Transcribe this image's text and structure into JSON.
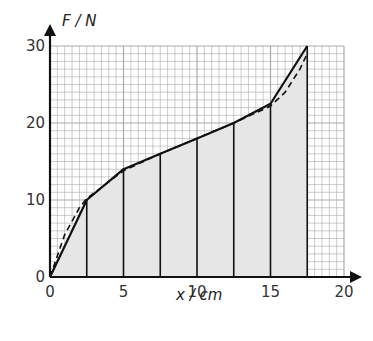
{
  "chart_data": {
    "type": "line",
    "title": "",
    "xlabel": "x / cm",
    "ylabel": "F / N",
    "xlim": [
      0,
      20
    ],
    "ylim": [
      0,
      30
    ],
    "x_ticks": [
      0,
      5,
      10,
      15,
      20
    ],
    "y_ticks": [
      0,
      10,
      20,
      30
    ],
    "grid": true,
    "grid_minor_x": 0.5,
    "grid_minor_y": 1,
    "series": [
      {
        "name": "trapezium approximation (solid)",
        "style": "solid",
        "x": [
          0,
          2.5,
          5,
          7.5,
          10,
          12.5,
          15,
          17.5
        ],
        "y": [
          0,
          10,
          14,
          16,
          18,
          20,
          22.5,
          30
        ]
      },
      {
        "name": "force curve (dashed)",
        "style": "dashed",
        "x": [
          0,
          1,
          2,
          2.5,
          5,
          7.5,
          10,
          12.5,
          15,
          16,
          17,
          17.5
        ],
        "y": [
          0,
          5.5,
          9,
          10.2,
          13.8,
          16,
          18,
          20,
          22.2,
          24,
          27,
          29
        ]
      }
    ],
    "vertical_strips_at_x": [
      2.5,
      5,
      7.5,
      10,
      12.5,
      15,
      17.5
    ],
    "shaded_area": "area under solid line from x=0 to x=17.5"
  },
  "labels": {
    "y_axis": "F / N",
    "x_axis": "x / cm",
    "y_ticks": [
      "0",
      "10",
      "20",
      "30"
    ],
    "x_ticks": [
      "0",
      "5",
      "10",
      "15",
      "20"
    ]
  },
  "colors": {
    "grid": "#aaaaaa",
    "fill": "#e6e6e6",
    "line": "#111111",
    "text": "#333333"
  }
}
